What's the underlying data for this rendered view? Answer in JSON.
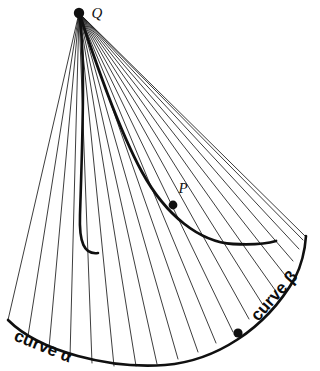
{
  "figure": {
    "kind": "geometry-diagram",
    "background_color": "#ffffff",
    "ink_color": "#111111"
  },
  "points": [
    {
      "id": "Q",
      "label": "Q",
      "x": 79,
      "y": 13,
      "label_x": 97,
      "label_y": 15,
      "marker_r": 5.2
    },
    {
      "id": "P",
      "label": "P",
      "x": 173,
      "y": 205,
      "label_x": 183,
      "label_y": 190,
      "marker_r": 4.4
    },
    {
      "id": "B",
      "label": "",
      "x": 238,
      "y": 333,
      "label_x": 0,
      "label_y": 0,
      "marker_r": 4.6
    }
  ],
  "curves": {
    "alpha": {
      "label": "curve α",
      "label_x": 13,
      "label_y": 340,
      "label_rotation": 22,
      "font_size": 17
    },
    "beta": {
      "label": "curve β",
      "label_x": 258,
      "label_y": 322,
      "label_rotation": -48,
      "font_size": 17
    },
    "base_arc_path": "M 8,320 C 40,352 110,369 165,365 C 215,361 265,330 295,278 C 301,266 305,250 306,236",
    "envelope_path": "M 79,13 C 86,55 82,150 80,215 C 79,242 84,255 98,253",
    "envelope_lower_path": "M 79,13 C 95,60 118,128 142,172 C 166,216 200,242 233,244 C 252,245 266,244 276,241"
  },
  "tangent_lines": {
    "count": 22,
    "stroke_width": 0.85,
    "fan_origin": {
      "x": 79,
      "y": 13
    },
    "endpoints": [
      {
        "x": 8,
        "y": 320
      },
      {
        "x": 28,
        "y": 336
      },
      {
        "x": 49,
        "y": 348
      },
      {
        "x": 70,
        "y": 357
      },
      {
        "x": 92,
        "y": 363
      },
      {
        "x": 114,
        "y": 366
      },
      {
        "x": 136,
        "y": 366
      },
      {
        "x": 157,
        "y": 364
      },
      {
        "x": 178,
        "y": 359
      },
      {
        "x": 198,
        "y": 352
      },
      {
        "x": 216,
        "y": 343
      },
      {
        "x": 233,
        "y": 332
      },
      {
        "x": 249,
        "y": 319
      },
      {
        "x": 263,
        "y": 305
      },
      {
        "x": 275,
        "y": 290
      },
      {
        "x": 285,
        "y": 275
      },
      {
        "x": 293,
        "y": 261
      },
      {
        "x": 299,
        "y": 249
      },
      {
        "x": 303,
        "y": 240
      },
      {
        "x": 305,
        "y": 236
      }
    ]
  }
}
